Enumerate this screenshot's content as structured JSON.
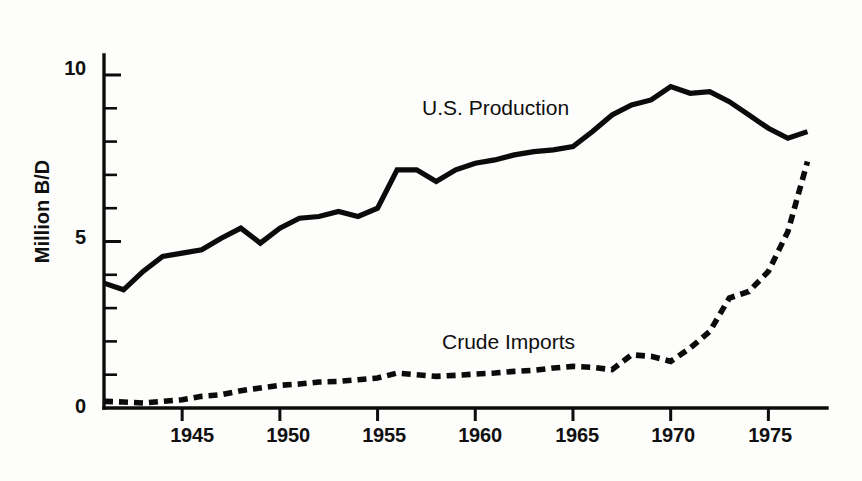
{
  "chart_data": {
    "type": "line",
    "title": "",
    "subtitle": "",
    "xlabel": "",
    "ylabel": "Million B/D",
    "xlim": [
      1941,
      1978
    ],
    "ylim": [
      0,
      10.6
    ],
    "grid": false,
    "legend_position": "inline-annotations",
    "x_ticks": [
      1945,
      1950,
      1955,
      1960,
      1965,
      1970,
      1975
    ],
    "x_tick_labels": [
      "1945",
      "1950",
      "1955",
      "1960",
      "1965",
      "1970",
      "1975"
    ],
    "y_ticks": [
      0,
      5,
      10
    ],
    "y_tick_labels": [
      "0",
      "5",
      "10"
    ],
    "y_minor_ticks": [
      1,
      2,
      3,
      4,
      6,
      7,
      8,
      9
    ],
    "annotations": [
      {
        "text": "U.S. Production",
        "x": 1957,
        "ylabel_pos": 9.1
      },
      {
        "text": "Crude Imports",
        "x": 1958,
        "ylabel_pos": 2.2
      }
    ],
    "series": [
      {
        "name": "U.S. Production",
        "style": "solid",
        "color": "#0b0b0b",
        "x": [
          1941,
          1942,
          1943,
          1944,
          1945,
          1946,
          1947,
          1948,
          1949,
          1950,
          1951,
          1952,
          1953,
          1954,
          1955,
          1956,
          1957,
          1958,
          1959,
          1960,
          1961,
          1962,
          1963,
          1964,
          1965,
          1966,
          1967,
          1968,
          1969,
          1970,
          1971,
          1972,
          1973,
          1974,
          1975,
          1976,
          1977
        ],
        "values": [
          3.75,
          3.55,
          4.1,
          4.55,
          4.65,
          4.75,
          5.1,
          5.4,
          4.95,
          5.4,
          5.7,
          5.75,
          5.9,
          5.75,
          6.0,
          7.15,
          7.15,
          6.8,
          7.15,
          7.35,
          7.45,
          7.6,
          7.7,
          7.75,
          7.85,
          8.3,
          8.8,
          9.1,
          9.25,
          9.65,
          9.45,
          9.5,
          9.2,
          8.8,
          8.4,
          8.1,
          8.3
        ]
      },
      {
        "name": "Crude Imports",
        "style": "dashed",
        "color": "#0b0b0b",
        "x": [
          1941,
          1942,
          1943,
          1944,
          1945,
          1946,
          1947,
          1948,
          1949,
          1950,
          1951,
          1952,
          1953,
          1954,
          1955,
          1956,
          1957,
          1958,
          1959,
          1960,
          1961,
          1962,
          1963,
          1964,
          1965,
          1966,
          1967,
          1968,
          1969,
          1970,
          1971,
          1972,
          1973,
          1974,
          1975,
          1976,
          1977
        ],
        "values": [
          0.2,
          0.18,
          0.15,
          0.2,
          0.25,
          0.35,
          0.4,
          0.52,
          0.6,
          0.68,
          0.72,
          0.78,
          0.8,
          0.85,
          0.9,
          1.05,
          1.0,
          0.95,
          0.98,
          1.02,
          1.05,
          1.1,
          1.13,
          1.2,
          1.25,
          1.22,
          1.15,
          1.6,
          1.55,
          1.4,
          1.8,
          2.3,
          3.3,
          3.5,
          4.1,
          5.3,
          7.4
        ]
      }
    ]
  },
  "axis": {
    "y_title": "Million B/D"
  }
}
